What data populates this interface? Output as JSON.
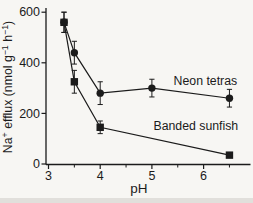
{
  "figure": {
    "bg": "#f7f6f3",
    "ink": "#1b1b1b"
  },
  "chart_data": {
    "type": "line",
    "title": "",
    "xlabel": "pH",
    "ylabel": "Na+ efflux (nmol g-1 h-1)",
    "ylabel_rich": [
      {
        "t": "Na",
        "sup": false
      },
      {
        "t": "+",
        "sup": true
      },
      {
        "t": " efflux (nmol g",
        "sup": false
      },
      {
        "t": "−1",
        "sup": true
      },
      {
        "t": " h",
        "sup": false
      },
      {
        "t": "−1",
        "sup": true
      },
      {
        "t": ")",
        "sup": false
      }
    ],
    "xlim": [
      2.95,
      6.9
    ],
    "ylim": [
      0,
      640
    ],
    "x_ticks": [
      3,
      4,
      5,
      6
    ],
    "x_minor_ticks": [
      3.5,
      4.5,
      5.5,
      6.5
    ],
    "y_ticks": [
      0,
      200,
      400,
      600
    ],
    "grid": false,
    "legend_position": "inline-annotations",
    "series": [
      {
        "name": "Neon tetras",
        "marker": "circle",
        "points": [
          {
            "x": 3.3,
            "y": 560,
            "err": 40
          },
          {
            "x": 3.5,
            "y": 440,
            "err": 45
          },
          {
            "x": 4.0,
            "y": 280,
            "err": 45
          },
          {
            "x": 5.0,
            "y": 300,
            "err": 35
          },
          {
            "x": 6.5,
            "y": 260,
            "err": 35
          }
        ],
        "label": {
          "x": 5.42,
          "y": 330
        }
      },
      {
        "name": "Banded sunfish",
        "marker": "square",
        "points": [
          {
            "x": 3.3,
            "y": 560,
            "err": 40
          },
          {
            "x": 3.5,
            "y": 325,
            "err": 45
          },
          {
            "x": 4.0,
            "y": 145,
            "err": 25
          },
          {
            "x": 6.5,
            "y": 35,
            "err": 0
          }
        ],
        "label": {
          "x": 5.03,
          "y": 152
        }
      }
    ]
  }
}
